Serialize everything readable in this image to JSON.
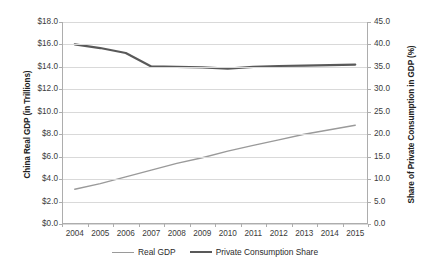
{
  "chart_data": {
    "type": "line",
    "title": "",
    "subtitle": "",
    "xlabel": "",
    "categories": [
      "2004",
      "2005",
      "2006",
      "2007",
      "2008",
      "2009",
      "2010",
      "2011",
      "2012",
      "2013",
      "2014",
      "2015"
    ],
    "grid": true,
    "legend_position": "bottom",
    "axes": {
      "left": {
        "label": "China Real GDP (in Trillions)",
        "ticks": [
          "$0.0",
          "$2.0",
          "$4.0",
          "$6.0",
          "$8.0",
          "$10.0",
          "$12.0",
          "$14.0",
          "$16.0",
          "$18.0"
        ],
        "tick_values": [
          0,
          2,
          4,
          6,
          8,
          10,
          12,
          14,
          16,
          18
        ],
        "min": 0,
        "max": 18
      },
      "right": {
        "label": "Share of Private Consumption in GDP (%)",
        "ticks": [
          "0.0",
          "5.0",
          "10.0",
          "15.0",
          "20.0",
          "25.0",
          "30.0",
          "35.0",
          "40.0",
          "45.0"
        ],
        "tick_values": [
          0,
          5,
          10,
          15,
          20,
          25,
          30,
          35,
          40,
          45
        ],
        "min": 0,
        "max": 45
      }
    },
    "series": [
      {
        "name": "Real GDP",
        "axis": "left",
        "color": "#9a9a9a",
        "width": 1.4,
        "values": [
          3.1,
          3.6,
          4.2,
          4.8,
          5.4,
          5.9,
          6.5,
          7.0,
          7.5,
          8.0,
          8.4,
          8.8
        ]
      },
      {
        "name": "Private Consumption Share",
        "axis": "right",
        "color": "#595959",
        "width": 2.2,
        "values": [
          40.0,
          39.2,
          38.1,
          35.1,
          35.0,
          34.9,
          34.6,
          35.0,
          35.2,
          35.3,
          35.4,
          35.5
        ]
      }
    ],
    "legend": [
      {
        "label": "Real GDP",
        "color": "#9a9a9a",
        "width": 1.4
      },
      {
        "label": "Private Consumption Share",
        "color": "#595959",
        "width": 2.2
      }
    ]
  },
  "colors": {
    "background": "#ffffff",
    "gridline": "#d9d9d9",
    "axis": "#adadad",
    "text": "#3b3b3b",
    "series_gdp": "#9a9a9a",
    "series_share": "#595959"
  }
}
